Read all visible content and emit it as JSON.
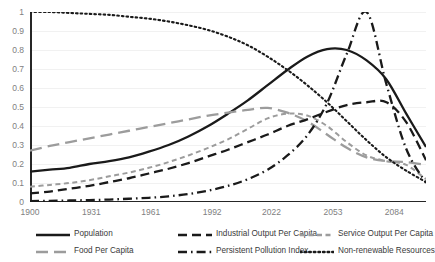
{
  "chart_data": {
    "type": "line",
    "title": "",
    "xlabel": "",
    "ylabel": "",
    "xlim": [
      1900,
      2100
    ],
    "ylim": [
      0,
      1
    ],
    "grid": true,
    "legend_position": "bottom",
    "x_ticks": [
      "1900",
      "1931",
      "1961",
      "1992",
      "2022",
      "2053",
      "2084"
    ],
    "x_tick_values": [
      1900,
      1931,
      1961,
      1992,
      2022,
      2053,
      2084
    ],
    "y_ticks": [
      "0",
      "0.1",
      "0.2",
      "0.3",
      "0.4",
      "0.5",
      "0.6",
      "0.7",
      "0.8",
      "0.9",
      "1"
    ],
    "y_tick_values": [
      0,
      0.1,
      0.2,
      0.3,
      0.4,
      0.5,
      0.6,
      0.7,
      0.8,
      0.9,
      1
    ],
    "x": [
      1900,
      1910,
      1920,
      1930,
      1940,
      1950,
      1960,
      1970,
      1980,
      1990,
      2000,
      2010,
      2020,
      2030,
      2040,
      2050,
      2060,
      2070,
      2080,
      2090,
      2100
    ],
    "series": [
      {
        "name": "Population",
        "color": "#1a1a1a",
        "style": "solid",
        "values": [
          0.16,
          0.17,
          0.18,
          0.2,
          0.215,
          0.235,
          0.265,
          0.3,
          0.345,
          0.4,
          0.465,
          0.535,
          0.615,
          0.695,
          0.765,
          0.805,
          0.8,
          0.745,
          0.645,
          0.465,
          0.29
        ]
      },
      {
        "name": "Food Per Capita",
        "color": "#9c9c9c",
        "style": "long-dash",
        "values": [
          0.27,
          0.295,
          0.315,
          0.335,
          0.355,
          0.375,
          0.395,
          0.415,
          0.435,
          0.455,
          0.47,
          0.485,
          0.495,
          0.47,
          0.425,
          0.355,
          0.285,
          0.235,
          0.215,
          0.21,
          0.195
        ]
      },
      {
        "name": "Industrial Output Per Capita",
        "color": "#1a1a1a",
        "style": "dash",
        "values": [
          0.045,
          0.055,
          0.07,
          0.085,
          0.105,
          0.125,
          0.15,
          0.175,
          0.205,
          0.24,
          0.275,
          0.315,
          0.355,
          0.4,
          0.435,
          0.475,
          0.51,
          0.525,
          0.525,
          0.42,
          0.22
        ]
      },
      {
        "name": "Service Output Per Capita",
        "color": "#9c9c9c",
        "style": "short-dash",
        "values": [
          0.08,
          0.09,
          0.1,
          0.115,
          0.135,
          0.155,
          0.18,
          0.21,
          0.245,
          0.285,
          0.33,
          0.385,
          0.44,
          0.465,
          0.455,
          0.4,
          0.315,
          0.245,
          0.215,
          0.195,
          0.12
        ]
      },
      {
        "name": "Persistent Pollution Index",
        "color": "#1a1a1a",
        "style": "dash-dot",
        "values": [
          0.005,
          0.006,
          0.008,
          0.01,
          0.013,
          0.017,
          0.022,
          0.03,
          0.042,
          0.06,
          0.085,
          0.12,
          0.17,
          0.245,
          0.35,
          0.52,
          0.78,
          1.0,
          0.62,
          0.28,
          0.1
        ]
      },
      {
        "name": "Non-renewable Resources",
        "color": "#1a1a1a",
        "style": "dot",
        "values": [
          1.0,
          1.0,
          0.995,
          0.99,
          0.985,
          0.975,
          0.965,
          0.95,
          0.93,
          0.905,
          0.87,
          0.825,
          0.765,
          0.695,
          0.615,
          0.525,
          0.425,
          0.325,
          0.235,
          0.165,
          0.105
        ]
      }
    ]
  },
  "legend": {
    "items": [
      {
        "label": "Population",
        "swatch": "legend-line-solid-black"
      },
      {
        "label": "Industrial Output Per Capita",
        "swatch": "legend-line-dash-black"
      },
      {
        "label": "Service Output Per Capita",
        "swatch": "legend-line-short-dash-gray"
      },
      {
        "label": "Food Per Capita",
        "swatch": "legend-line-long-dash-gray"
      },
      {
        "label": "Persistent Pollution Index",
        "swatch": "legend-line-dash-dot-black"
      },
      {
        "label": "Non-renewable Resources",
        "swatch": "legend-line-dot-black"
      }
    ]
  }
}
